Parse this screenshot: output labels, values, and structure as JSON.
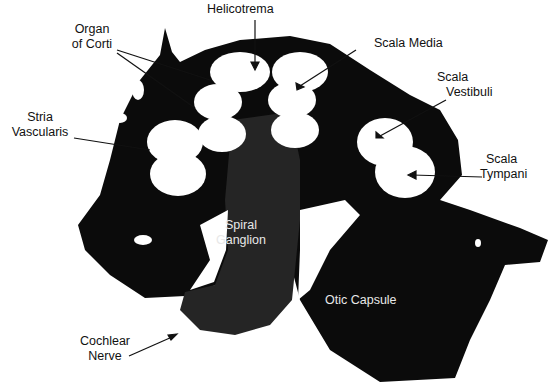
{
  "figure": {
    "colors": {
      "bone": "#0b0b0b",
      "tissue": "#2a2a2a",
      "background": "#ffffff",
      "label": "#111111",
      "inverse_label": "#e8e8e8"
    }
  },
  "labels": {
    "helicotrema": "Helicotrema",
    "organ_of_corti_line1": "Organ",
    "organ_of_corti_line2": "of Corti",
    "scala_media": "Scala Media",
    "scala_vestibuli_line1": "Scala",
    "scala_vestibuli_line2": "Vestibuli",
    "stria_vascularis_line1": "Stria",
    "stria_vascularis_line2": "Vascularis",
    "scala_tympani_line1": "Scala",
    "scala_tympani_line2": "Tympani",
    "spiral_ganglion_line1": "Spiral",
    "spiral_ganglion_line2": "Ganglion",
    "otic_capsule": "Otic Capsule",
    "cochlear_nerve_line1": "Cochlear",
    "cochlear_nerve_line2": "Nerve"
  }
}
